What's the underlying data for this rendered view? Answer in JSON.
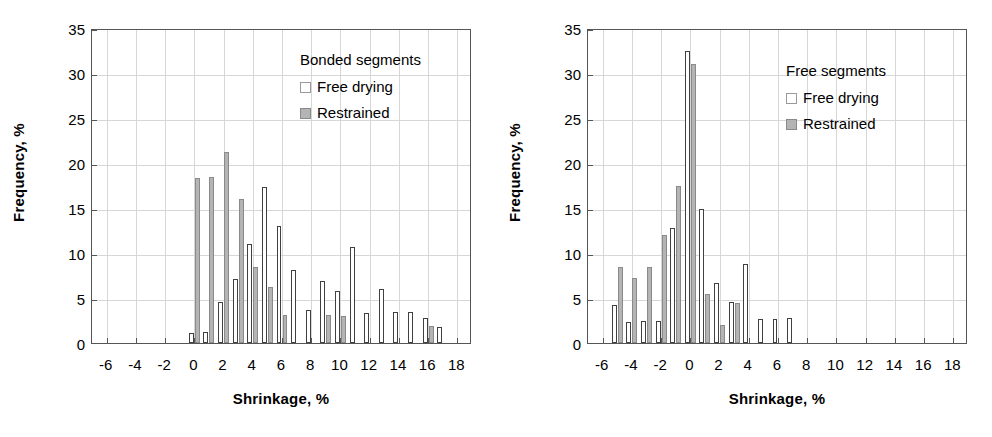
{
  "figure": {
    "panels": [
      {
        "id": "bonded",
        "legend_title": "Bonded segments",
        "legend": [
          {
            "label": "Free drying",
            "swatch": "white-square-icon"
          },
          {
            "label": "Restrained",
            "swatch": "gray-square-icon"
          }
        ]
      },
      {
        "id": "free",
        "legend_title": "Free segments",
        "legend": [
          {
            "label": "Free drying",
            "swatch": "white-square-icon"
          },
          {
            "label": "Restrained",
            "swatch": "gray-square-icon"
          }
        ]
      }
    ],
    "axis": {
      "xlabel": "Shrinkage, %",
      "ylabel": "Frequency, %",
      "xticks": [
        "-6",
        "-4",
        "-2",
        "0",
        "2",
        "4",
        "6",
        "8",
        "10",
        "12",
        "14",
        "16",
        "18"
      ],
      "yticks": [
        "0",
        "5",
        "10",
        "15",
        "20",
        "25",
        "30",
        "35"
      ]
    },
    "colors": {
      "free_drying": "#ffffff",
      "restrained": "#b4b4b4",
      "outline": "#404040",
      "grid": "#d6d6d6",
      "frame": "#555555"
    }
  },
  "chart_data": [
    {
      "type": "bar",
      "title": "Bonded segments",
      "xlabel": "Shrinkage, %",
      "ylabel": "Frequency, %",
      "xlim": [
        -7,
        19
      ],
      "ylim": [
        0,
        35
      ],
      "ytick_step": 5,
      "xtick_step": 2,
      "grid": true,
      "legend_position": "top-right",
      "x": [
        0,
        1,
        2,
        3,
        4,
        5,
        6,
        7,
        8,
        9,
        10,
        11,
        12,
        13,
        14,
        15,
        16,
        17
      ],
      "series": [
        {
          "name": "Free drying",
          "values": [
            1.1,
            1.2,
            4.6,
            7.1,
            11.0,
            17.3,
            13.0,
            8.1,
            3.7,
            6.9,
            5.8,
            10.7,
            3.3,
            6.0,
            3.5,
            3.5,
            2.8,
            1.8
          ]
        },
        {
          "name": "Restrained",
          "values": [
            18.3,
            18.4,
            21.2,
            16.0,
            8.5,
            6.2,
            3.1,
            0,
            0,
            3.1,
            3.0,
            0,
            0,
            0,
            0,
            0,
            1.9,
            0
          ]
        }
      ]
    },
    {
      "type": "bar",
      "title": "Free segments",
      "xlabel": "Shrinkage, %",
      "ylabel": "Frequency, %",
      "xlim": [
        -7,
        19
      ],
      "ylim": [
        0,
        35
      ],
      "ytick_step": 5,
      "xtick_step": 2,
      "grid": true,
      "legend_position": "top-right",
      "x": [
        -5,
        -4,
        -3,
        -2,
        -1,
        0,
        1,
        2,
        3,
        4,
        5,
        6,
        7
      ],
      "series": [
        {
          "name": "Free drying",
          "values": [
            4.2,
            2.3,
            2.4,
            2.4,
            12.8,
            32.5,
            14.9,
            6.7,
            4.6,
            8.8,
            2.7,
            2.7,
            2.8
          ]
        },
        {
          "name": "Restrained",
          "values": [
            8.5,
            7.2,
            8.5,
            12.0,
            17.5,
            31.0,
            5.4,
            2.0,
            4.4,
            0,
            0,
            0,
            0
          ]
        }
      ]
    }
  ]
}
